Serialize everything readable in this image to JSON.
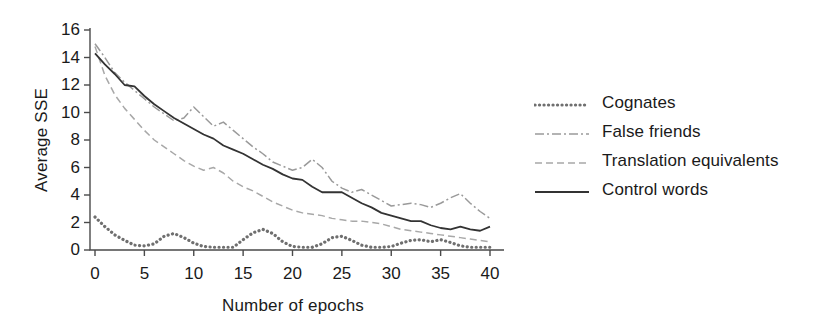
{
  "chart_data": {
    "type": "line",
    "title": "",
    "xlabel": "Number of epochs",
    "ylabel": "Average SSE",
    "xlim": [
      0,
      41
    ],
    "ylim": [
      0,
      16
    ],
    "xticks": [
      0,
      5,
      10,
      15,
      20,
      25,
      30,
      35,
      40
    ],
    "xtick_labels": [
      "0",
      "5",
      "10",
      "15",
      "20",
      "25",
      "30",
      "35",
      "40"
    ],
    "yticks": [
      0,
      2,
      4,
      6,
      8,
      10,
      12,
      14,
      16
    ],
    "ytick_labels": [
      "0",
      "2",
      "4",
      "6",
      "8",
      "10",
      "12",
      "14",
      "16"
    ],
    "grid": false,
    "legend_position": "right",
    "x": [
      0,
      1,
      2,
      3,
      4,
      5,
      6,
      7,
      8,
      9,
      10,
      11,
      12,
      13,
      14,
      15,
      16,
      17,
      18,
      19,
      20,
      21,
      22,
      23,
      24,
      25,
      26,
      27,
      28,
      29,
      30,
      31,
      32,
      33,
      34,
      35,
      36,
      37,
      38,
      39,
      40
    ],
    "series": [
      {
        "name": "Cognates",
        "style": "dotted",
        "color": "#6f6f6f",
        "values": [
          2.4,
          1.7,
          1.1,
          0.7,
          0.35,
          0.3,
          0.45,
          1.0,
          1.2,
          0.9,
          0.5,
          0.25,
          0.2,
          0.2,
          0.2,
          0.75,
          1.25,
          1.5,
          1.2,
          0.6,
          0.25,
          0.2,
          0.2,
          0.45,
          0.9,
          1.0,
          0.7,
          0.35,
          0.2,
          0.2,
          0.25,
          0.5,
          0.7,
          0.75,
          0.6,
          0.75,
          0.55,
          0.3,
          0.2,
          0.2,
          0.2
        ]
      },
      {
        "name": "False friends",
        "style": "dash-dot",
        "color": "#9a9a9a",
        "values": [
          15.0,
          14.0,
          12.9,
          12.2,
          11.6,
          11.0,
          10.4,
          9.9,
          9.4,
          9.6,
          10.4,
          9.7,
          9.0,
          9.3,
          8.7,
          8.1,
          7.5,
          7.0,
          6.4,
          6.1,
          5.8,
          6.0,
          6.6,
          6.0,
          5.0,
          4.5,
          4.2,
          4.4,
          4.0,
          3.6,
          3.2,
          3.3,
          3.4,
          3.3,
          3.1,
          3.4,
          3.8,
          4.1,
          3.4,
          2.8,
          2.3
        ]
      },
      {
        "name": "Translation equivalents",
        "style": "dashed",
        "color": "#a8a8a8",
        "values": [
          14.8,
          12.7,
          11.3,
          10.3,
          9.5,
          8.7,
          8.0,
          7.5,
          7.0,
          6.5,
          6.1,
          5.8,
          6.0,
          5.6,
          5.0,
          4.6,
          4.3,
          3.9,
          3.5,
          3.2,
          2.9,
          2.7,
          2.6,
          2.5,
          2.3,
          2.2,
          2.1,
          2.1,
          2.0,
          1.9,
          1.7,
          1.5,
          1.4,
          1.3,
          1.2,
          1.1,
          1.0,
          0.9,
          0.8,
          0.7,
          0.6
        ]
      },
      {
        "name": "Control words",
        "style": "solid",
        "color": "#333333",
        "values": [
          14.3,
          13.5,
          12.8,
          12.0,
          11.9,
          11.2,
          10.6,
          10.1,
          9.6,
          9.2,
          8.8,
          8.4,
          8.1,
          7.6,
          7.3,
          7.0,
          6.6,
          6.2,
          5.9,
          5.5,
          5.2,
          5.1,
          4.6,
          4.2,
          4.2,
          4.2,
          3.8,
          3.4,
          3.1,
          2.7,
          2.5,
          2.3,
          2.1,
          2.1,
          1.8,
          1.6,
          1.5,
          1.7,
          1.5,
          1.4,
          1.7
        ]
      }
    ]
  },
  "legend": {
    "items": [
      {
        "label": "Cognates"
      },
      {
        "label": "False friends"
      },
      {
        "label": "Translation equivalents"
      },
      {
        "label": "Control words"
      }
    ]
  }
}
